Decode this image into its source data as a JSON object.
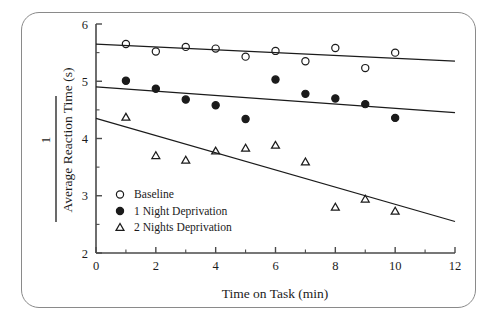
{
  "figure": {
    "name": "reaction-time-vs-time-on-task",
    "frame_color": "#8a8a8a",
    "ink_color": "#1b1b1b",
    "background": "#ffffff"
  },
  "chart_data": {
    "type": "scatter",
    "title": "",
    "xlabel": "Time on Task (min)",
    "ylabel": "Average Reaction Time (s)",
    "ylabel_numerator": "1",
    "ylabel_is_reciprocal": true,
    "xlim": [
      0,
      12
    ],
    "ylim": [
      2,
      6
    ],
    "xticks": [
      0,
      2,
      4,
      6,
      8,
      10,
      12
    ],
    "xtick_labels": [
      "0",
      "2",
      "4",
      "6",
      "8",
      "10",
      "12"
    ],
    "xminor_ticks": [
      1,
      3,
      5,
      7,
      9,
      11
    ],
    "yticks": [
      2,
      3,
      4,
      5,
      6
    ],
    "ytick_labels": [
      "2",
      "3",
      "4",
      "5",
      "6"
    ],
    "yminor_ticks": [
      2.5,
      3.5,
      4.5,
      5.5
    ],
    "grid": false,
    "legend_position": "lower-left-inside",
    "x": [
      1,
      2,
      3,
      4,
      5,
      6,
      7,
      8,
      9,
      10
    ],
    "series": [
      {
        "name": "Baseline",
        "marker": "open-circle",
        "values": [
          5.65,
          5.52,
          5.6,
          5.57,
          5.43,
          5.53,
          5.35,
          5.58,
          5.23,
          5.5
        ],
        "trend_line": {
          "x0": 0,
          "y0": 5.65,
          "x1": 12,
          "y1": 5.35
        }
      },
      {
        "name": "1 Night Deprivation",
        "marker": "filled-circle",
        "values": [
          5.01,
          4.87,
          4.68,
          4.58,
          4.34,
          5.03,
          4.78,
          4.7,
          4.6,
          4.36
        ],
        "trend_line": {
          "x0": 0,
          "y0": 4.9,
          "x1": 12,
          "y1": 4.45
        }
      },
      {
        "name": "2 Nights Deprivation",
        "marker": "open-triangle",
        "values": [
          4.37,
          3.7,
          3.62,
          3.78,
          3.83,
          3.88,
          3.59,
          2.8,
          2.94,
          2.73
        ],
        "trend_line": {
          "x0": 0,
          "y0": 4.35,
          "x1": 12,
          "y1": 2.55
        }
      }
    ],
    "legend": [
      {
        "label": "Baseline",
        "marker": "open-circle"
      },
      {
        "label": "1 Night Deprivation",
        "marker": "filled-circle"
      },
      {
        "label": "2 Nights Deprivation",
        "marker": "open-triangle"
      }
    ]
  }
}
